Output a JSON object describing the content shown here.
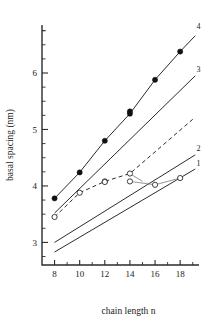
{
  "chart_data": {
    "type": "line",
    "title": "",
    "xlabel": "chain length n",
    "ylabel": "basal spacing (nm)",
    "xlim": [
      7.0,
      19.5
    ],
    "ylim": [
      2.6,
      6.85
    ],
    "xticks": [
      8,
      10,
      12,
      14,
      16,
      18
    ],
    "xticklabels": [
      "8",
      "10",
      "12",
      "14",
      "16",
      "18"
    ],
    "yticks": [
      3,
      4,
      5,
      6
    ],
    "yticklabels": [
      "3",
      "4",
      "5",
      "6"
    ],
    "yminorticks": [
      2.75,
      3.25,
      3.5,
      3.75,
      4.25,
      4.5,
      4.75,
      5.25,
      5.5,
      5.75,
      6.25,
      6.5,
      6.75
    ],
    "grid": false,
    "legend_position": "right-inline-curve-labels",
    "series": [
      {
        "name": "1",
        "label": "1",
        "linestyle": "solid",
        "marker": "none",
        "label_x": 19.3,
        "label_y": 4.36,
        "x": [
          8,
          19.2
        ],
        "y": [
          2.83,
          4.3
        ]
      },
      {
        "name": "2",
        "label": "2",
        "linestyle": "solid",
        "marker": "none",
        "label_x": 19.3,
        "label_y": 4.62,
        "x": [
          8,
          19.2
        ],
        "y": [
          3.0,
          4.55
        ]
      },
      {
        "name": "3",
        "label": "3",
        "linestyle": "solid",
        "marker": "none",
        "label_x": 19.3,
        "label_y": 6.02,
        "x": [
          8,
          19.2
        ],
        "y": [
          3.52,
          5.95
        ]
      },
      {
        "name": "4",
        "label": "4",
        "linestyle": "solid",
        "marker": "filled-circle",
        "label_x": 19.3,
        "label_y": 6.78,
        "x": [
          8,
          10,
          12,
          14,
          16,
          18,
          19.2
        ],
        "y": [
          3.78,
          4.24,
          4.8,
          5.28,
          5.88,
          6.38,
          6.66
        ]
      },
      {
        "name": "dashed-experimental",
        "label": "",
        "linestyle": "dashed",
        "marker": "open-circle",
        "label_x": null,
        "label_y": null,
        "x": [
          8,
          10,
          12,
          14,
          19.0
        ],
        "y": [
          3.45,
          3.88,
          4.08,
          4.22,
          5.18
        ]
      }
    ],
    "open_markers": [
      {
        "x": 8,
        "y": 3.45
      },
      {
        "x": 10,
        "y": 3.88
      },
      {
        "x": 12,
        "y": 4.08
      },
      {
        "x": 12,
        "y": 4.07
      },
      {
        "x": 14,
        "y": 4.22
      },
      {
        "x": 14,
        "y": 4.08
      },
      {
        "x": 16,
        "y": 4.02
      },
      {
        "x": 18,
        "y": 4.14
      }
    ],
    "filled_markers": [
      {
        "x": 8,
        "y": 3.78
      },
      {
        "x": 10,
        "y": 4.24
      },
      {
        "x": 12,
        "y": 4.8
      },
      {
        "x": 14,
        "y": 5.28
      },
      {
        "x": 14,
        "y": 5.32
      },
      {
        "x": 16,
        "y": 5.88
      },
      {
        "x": 18,
        "y": 6.38
      }
    ],
    "connectors": [
      {
        "x1": 14,
        "y1": 4.22,
        "x2": 15.0,
        "y2": 4.08
      },
      {
        "x1": 14,
        "y1": 4.08,
        "x2": 16,
        "y2": 4.02
      },
      {
        "x1": 16,
        "y1": 4.02,
        "x2": 18,
        "y2": 4.14
      }
    ],
    "colors": {
      "axis": "#2b2b2b",
      "curve": "#2b2b2b",
      "marker_fill": "#101010",
      "marker_open_fill": "#ffffff",
      "connector": "#7a7a7a",
      "background": "#ffffff"
    }
  }
}
